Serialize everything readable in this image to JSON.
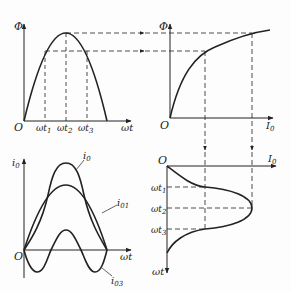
{
  "diagram": {
    "colors": {
      "stroke": "#222222",
      "background": "#fdfdfd"
    },
    "panels": {
      "top_left": {
        "y_axis_label": "Φ",
        "x_axis_label": "ωt",
        "origin_label": "O",
        "ticks": [
          "ωt",
          "ωt",
          "ωt"
        ],
        "tick_subs": [
          "1",
          "2",
          "3"
        ],
        "curve": "Φ(ωt) sinusoidal half-wave"
      },
      "top_right": {
        "y_axis_label": "Φ",
        "x_axis_label": "I",
        "x_axis_sub": "0",
        "origin_label": "O",
        "curve": "magnetization Φ(I0) saturation curve"
      },
      "bottom_right": {
        "x_axis_label": "I",
        "x_axis_sub": "0",
        "y_axis_label": "ωt",
        "origin_label": "O",
        "ticks": [
          "ωt",
          "ωt",
          "ωt"
        ],
        "tick_subs": [
          "1",
          "2",
          "3"
        ],
        "curve": "i0(ωt) peaked current"
      },
      "bottom_left": {
        "y_axis_label": "i",
        "y_axis_sub": "0",
        "x_axis_label": "ωt",
        "origin_label": "O",
        "curves": [
          {
            "name": "i",
            "sub": "0"
          },
          {
            "name": "i",
            "sub": "01"
          },
          {
            "name": "i",
            "sub": "03"
          }
        ]
      }
    }
  }
}
